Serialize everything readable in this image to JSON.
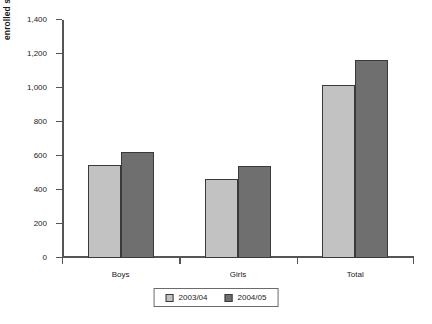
{
  "chart_data": {
    "type": "bar",
    "title": "",
    "xlabel": "",
    "ylabel": "enrolled students (thousand)",
    "categories": [
      "Boys",
      "Girls",
      "Total"
    ],
    "series": [
      {
        "name": "2003/04",
        "values": [
          550,
          465,
          1020
        ],
        "color": "#c2c2c2"
      },
      {
        "name": "2004/05",
        "values": [
          625,
          540,
          1165
        ],
        "color": "#6f6f6f"
      }
    ],
    "ylim": [
      0,
      1400
    ],
    "ytick_step": 200,
    "ytick_labels": [
      "0",
      "200",
      "400",
      "600",
      "800",
      "1,000",
      "1,200",
      "1,400"
    ],
    "ytick_values": [
      0,
      200,
      400,
      600,
      800,
      1000,
      1200,
      1400
    ],
    "grid": false,
    "legend_position": "bottom-center"
  }
}
